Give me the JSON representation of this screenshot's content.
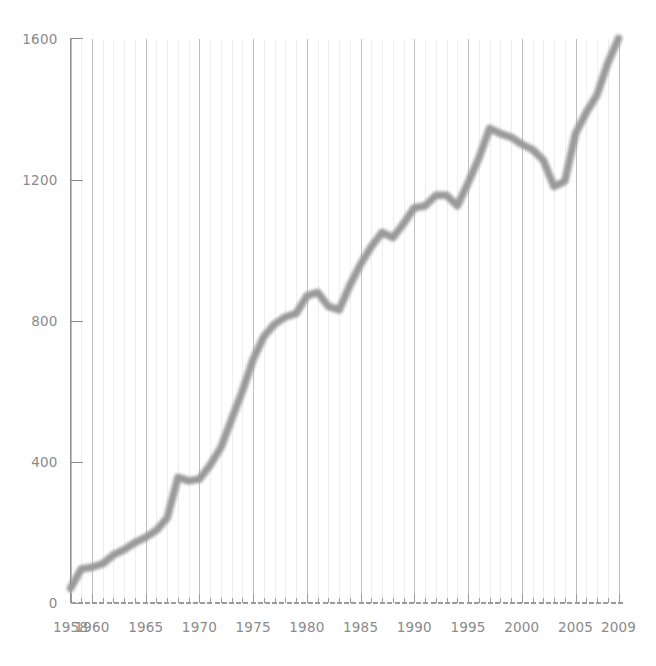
{
  "chart_data": {
    "type": "line",
    "title": "",
    "subtitle": "",
    "xlabel": "",
    "ylabel": "",
    "xlim": [
      1958,
      2009
    ],
    "ylim": [
      0,
      1600
    ],
    "yticks": [
      0,
      400,
      800,
      1200,
      1600
    ],
    "ytick_labels": [
      "0",
      "400",
      "800",
      "1200",
      "1600"
    ],
    "xticks": [
      1958,
      1960,
      1965,
      1970,
      1975,
      1980,
      1985,
      1990,
      1995,
      2000,
      2005,
      2009
    ],
    "xtick_labels": [
      "1958",
      "1960",
      "1965",
      "1970",
      "1975",
      "1980",
      "1985",
      "1990",
      "1995",
      "2000",
      "2005",
      "2009"
    ],
    "grid": "vertical-only",
    "grid_major_years": [
      1958,
      1960,
      1965,
      1970,
      1975,
      1980,
      1985,
      1990,
      1995,
      2000,
      2005,
      2009
    ],
    "legend": "none",
    "line_color": "#9a9a9a",
    "axis_color": "#8e8e8e",
    "gridline_major_color": "#b8b8b8",
    "gridline_minor_color": "#ececec",
    "label_color": "#8a8a8a",
    "background_color": "#ffffff",
    "series": [
      {
        "name": "value",
        "x": [
          1958,
          1959,
          1960,
          1961,
          1962,
          1963,
          1964,
          1965,
          1966,
          1967,
          1968,
          1969,
          1970,
          1971,
          1972,
          1973,
          1974,
          1975,
          1976,
          1977,
          1978,
          1979,
          1980,
          1981,
          1982,
          1983,
          1984,
          1985,
          1986,
          1987,
          1988,
          1989,
          1990,
          1991,
          1992,
          1993,
          1994,
          1995,
          1996,
          1997,
          1998,
          1999,
          2000,
          2001,
          2002,
          2003,
          2004,
          2005,
          2006,
          2007,
          2008,
          2009
        ],
        "values": [
          40,
          95,
          100,
          110,
          135,
          150,
          170,
          185,
          205,
          240,
          355,
          345,
          350,
          390,
          440,
          520,
          600,
          690,
          755,
          790,
          810,
          820,
          870,
          880,
          840,
          830,
          900,
          960,
          1010,
          1050,
          1035,
          1075,
          1120,
          1125,
          1155,
          1155,
          1125,
          1190,
          1260,
          1345,
          1330,
          1320,
          1300,
          1285,
          1255,
          1180,
          1195,
          1330,
          1390,
          1440,
          1530,
          1600
        ]
      }
    ]
  }
}
